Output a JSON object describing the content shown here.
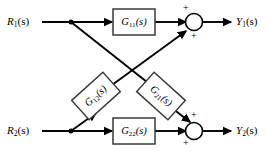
{
  "diagram": {
    "background_color": "#ffffff",
    "line_color": "#000000",
    "block_fill": "#ffffff",
    "block_stroke": "#3a3a3a"
  },
  "inputs": [
    {
      "name": "input-r1",
      "base": "R",
      "sub": "1",
      "arg": "(s)"
    },
    {
      "name": "input-r2",
      "base": "R",
      "sub": "2",
      "arg": "(s)"
    }
  ],
  "outputs": [
    {
      "name": "output-y1",
      "base": "Y",
      "sub": "1",
      "arg": "(s)"
    },
    {
      "name": "output-y2",
      "base": "Y",
      "sub": "2",
      "arg": "(s)"
    }
  ],
  "blocks": [
    {
      "name": "block-g11",
      "base": "G",
      "sub": "11",
      "arg": "(s)",
      "rotation": 0
    },
    {
      "name": "block-g12",
      "base": "G",
      "sub": "12",
      "arg": "(s)",
      "rotation": -42
    },
    {
      "name": "block-g21",
      "base": "G",
      "sub": "21",
      "arg": "(s)",
      "rotation": 42
    },
    {
      "name": "block-g22",
      "base": "G",
      "sub": "22",
      "arg": "(s)",
      "rotation": 0
    }
  ],
  "summing_junctions": [
    {
      "name": "summing-junction-1",
      "signs": [
        {
          "name": "sign-plus-top-1",
          "text": "+"
        },
        {
          "name": "sign-plus-bottom-1",
          "text": "+"
        }
      ]
    },
    {
      "name": "summing-junction-2",
      "signs": [
        {
          "name": "sign-plus-top-2",
          "text": "+"
        },
        {
          "name": "sign-plus-bottom-2",
          "text": "+"
        }
      ]
    }
  ]
}
